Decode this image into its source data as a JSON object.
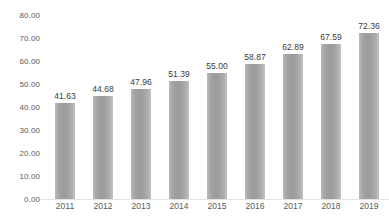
{
  "chart_data": {
    "type": "bar",
    "title": "",
    "subtitle": "",
    "xlabel": "",
    "ylabel": "",
    "categories": [
      "2011",
      "2012",
      "2013",
      "2014",
      "2015",
      "2016",
      "2017",
      "2018",
      "2019"
    ],
    "values": [
      41.63,
      44.68,
      47.96,
      51.39,
      55.0,
      58.87,
      62.89,
      67.59,
      72.36
    ],
    "data_labels": [
      "41.63",
      "44.68",
      "47.96",
      "51.39",
      "55.00",
      "58.87",
      "62.89",
      "67.59",
      "72.36"
    ],
    "ylim": [
      0,
      80
    ],
    "y_ticks": [
      80,
      70,
      60,
      50,
      40,
      30,
      20,
      10,
      0
    ],
    "y_tick_labels": [
      "80.00",
      "70.00",
      "60.00",
      "50.00",
      "40.00",
      "30.00",
      "20.00",
      "10.00",
      "0.00"
    ],
    "grid": false,
    "legend": null,
    "legend_position": "none",
    "bar_color": "#9b9b9b",
    "bar_highlight_color": "#c2c2c2",
    "label_color": "#3a3a3a",
    "axis_text_color": "#595959",
    "background_color": "#ffffff",
    "series": [
      {
        "name": "",
        "values": [
          41.63,
          44.68,
          47.96,
          51.39,
          55.0,
          58.87,
          62.89,
          67.59,
          72.36
        ]
      }
    ]
  }
}
